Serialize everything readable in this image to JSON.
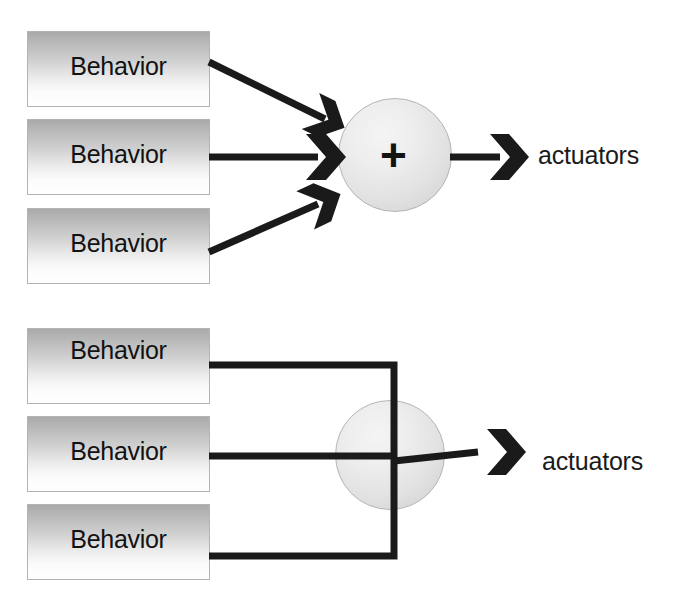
{
  "diagram": {
    "background_color": "#ffffff",
    "line_color": "#1a1a1a",
    "box_border_color": "#b3b3b3",
    "box_gradient_top_color": "#a9a9a9",
    "box_gradient_bottom_color": "#ffffff",
    "circle_fill_color": "#e6e6e6",
    "circle_border_color": "#b5b5b5",
    "text_color": "#121212"
  },
  "panels": [
    {
      "id": "summation-panel",
      "name": "cooperative-coordination",
      "boxes": [
        {
          "label": "Behavior"
        },
        {
          "label": "Behavior"
        },
        {
          "label": "Behavior"
        }
      ],
      "node": {
        "symbol": "+",
        "icon": "plus-icon"
      },
      "output": {
        "label": "actuators"
      },
      "connector_style": "diagonal-arrows"
    },
    {
      "id": "crossbar-panel",
      "name": "competitive-coordination",
      "boxes": [
        {
          "label": "Behavior"
        },
        {
          "label": "Behavior"
        },
        {
          "label": "Behavior"
        }
      ],
      "node": {
        "symbol": "",
        "icon": "crossed-circle-icon"
      },
      "output": {
        "label": "actuators"
      },
      "connector_style": "orthogonal-bus"
    }
  ]
}
